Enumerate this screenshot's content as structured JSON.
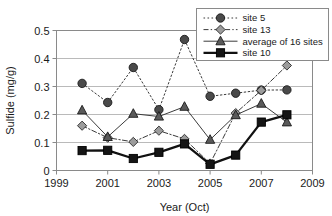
{
  "chart_data": {
    "type": "line",
    "title": "",
    "xlabel": "Year (Oct)",
    "ylabel": "Sulfide (mg/g)",
    "xlim": [
      1999,
      2009
    ],
    "ylim": [
      0,
      0.5
    ],
    "x_ticks": [
      "1999",
      "2001",
      "2003",
      "2005",
      "2007",
      "2009"
    ],
    "x_tick_values": [
      1999,
      2001,
      2003,
      2005,
      2007,
      2009
    ],
    "y_ticks": [
      "0",
      "0.1",
      "0.2",
      "0.3",
      "0.4",
      "0.5"
    ],
    "y_tick_values": [
      0,
      0.1,
      0.2,
      0.3,
      0.4,
      0.5
    ],
    "grid": true,
    "grid_axis": "y",
    "legend_position": "top-right",
    "x": [
      2000,
      2001,
      2002,
      2003,
      2004,
      2005,
      2006,
      2007,
      2008
    ],
    "series": [
      {
        "name": "site 5",
        "marker": "circle",
        "line_style": "dotted",
        "color": "#3b3b3b",
        "values": [
          0.311,
          0.243,
          0.368,
          0.217,
          0.468,
          0.265,
          0.276,
          0.287,
          0.288
        ]
      },
      {
        "name": "site 13",
        "marker": "diamond",
        "line_style": "dashdot",
        "color": "#3b3b3b",
        "values": [
          0.16,
          0.117,
          0.102,
          0.142,
          0.113,
          0.025,
          0.205,
          0.286,
          0.375
        ]
      },
      {
        "name": "average of 16 sites",
        "marker": "triangle",
        "line_style": "solid",
        "color": "#3b3b3b",
        "values": [
          0.215,
          0.12,
          0.203,
          0.193,
          0.228,
          0.11,
          0.198,
          0.239,
          0.172
        ]
      },
      {
        "name": "site 10",
        "marker": "square",
        "line_style": "solid-thick",
        "color": "#111111",
        "values": [
          0.071,
          0.072,
          0.043,
          0.065,
          0.095,
          0.022,
          0.055,
          0.173,
          0.199
        ]
      }
    ]
  },
  "legend": {
    "entries": [
      {
        "label": "site 5"
      },
      {
        "label": "site 13"
      },
      {
        "label": "average of 16 sites"
      },
      {
        "label": "site 10"
      }
    ]
  },
  "colors": {
    "axis": "#8a8a8a",
    "grid": "#a8a8a8",
    "text": "#1a1a1a",
    "marker_fill": "#4a4a4a",
    "marker_fill_light": "#9a9a9a",
    "marker_dark": "#111111",
    "background": "#ffffff"
  }
}
